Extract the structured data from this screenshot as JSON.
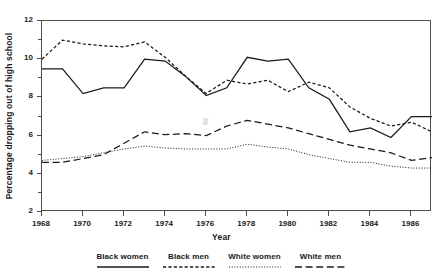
{
  "figure": {
    "top_clipped_text": "",
    "background": "#ffffff",
    "frame_color": "#4d4d4d"
  },
  "axes": {
    "y_title": "Percentage dropping out of high school",
    "x_title": "Year",
    "y_ticks": [
      2,
      4,
      6,
      8,
      10,
      12
    ],
    "y_minor_ticks": [
      3,
      5,
      7,
      9,
      11
    ],
    "y_min": 2,
    "y_max": 12,
    "x_ticks": [
      1968,
      1970,
      1972,
      1974,
      1976,
      1978,
      1980,
      1982,
      1984,
      1986
    ],
    "x_min": 1968,
    "x_max": 1987
  },
  "legend": {
    "position": "below-axis",
    "items": [
      {
        "label": "Black women",
        "style": "solid",
        "color": "#1a1a1a"
      },
      {
        "label": "Black men",
        "style": "dashed",
        "color": "#1a1a1a"
      },
      {
        "label": "White women",
        "style": "dotted",
        "color": "#1a1a1a"
      },
      {
        "label": "White men",
        "style": "long-dash",
        "color": "#1a1a1a"
      }
    ]
  },
  "chart_data": {
    "type": "line",
    "title": "",
    "subtitle": "",
    "xlabel": "Year",
    "ylabel": "Percentage dropping out of high school",
    "xlim": [
      1968,
      1987
    ],
    "ylim": [
      2,
      12
    ],
    "grid": false,
    "legend_position": "bottom",
    "x": [
      1968,
      1969,
      1970,
      1971,
      1972,
      1973,
      1974,
      1975,
      1976,
      1977,
      1978,
      1979,
      1980,
      1981,
      1982,
      1983,
      1984,
      1985,
      1986,
      1987
    ],
    "series": [
      {
        "name": "Black women",
        "style": "solid",
        "color": "#1a1a1a",
        "values": [
          9.5,
          9.5,
          8.2,
          8.5,
          8.5,
          10.0,
          9.9,
          9.1,
          8.1,
          8.5,
          10.1,
          9.9,
          10.0,
          8.5,
          7.9,
          6.2,
          6.4,
          5.9,
          7.0,
          7.0
        ]
      },
      {
        "name": "Black men",
        "style": "dashed",
        "color": "#1a1a1a",
        "values": [
          10.0,
          11.0,
          10.8,
          10.7,
          10.65,
          10.9,
          10.1,
          9.1,
          8.2,
          8.9,
          8.7,
          8.9,
          8.3,
          8.8,
          8.5,
          7.5,
          6.9,
          6.5,
          6.7,
          6.2
        ]
      },
      {
        "name": "White women",
        "style": "dotted",
        "color": "#1a1a1a",
        "values": [
          4.7,
          4.8,
          4.9,
          5.1,
          5.3,
          5.45,
          5.35,
          5.3,
          5.3,
          5.3,
          5.55,
          5.4,
          5.3,
          5.0,
          4.8,
          4.6,
          4.6,
          4.4,
          4.3,
          4.3
        ]
      },
      {
        "name": "White men",
        "style": "long-dash",
        "color": "#1a1a1a",
        "values": [
          4.6,
          4.6,
          4.8,
          5.0,
          5.6,
          6.2,
          6.05,
          6.1,
          6.0,
          6.5,
          6.8,
          6.6,
          6.4,
          6.1,
          5.8,
          5.5,
          5.3,
          5.1,
          4.7,
          4.85
        ]
      }
    ]
  }
}
